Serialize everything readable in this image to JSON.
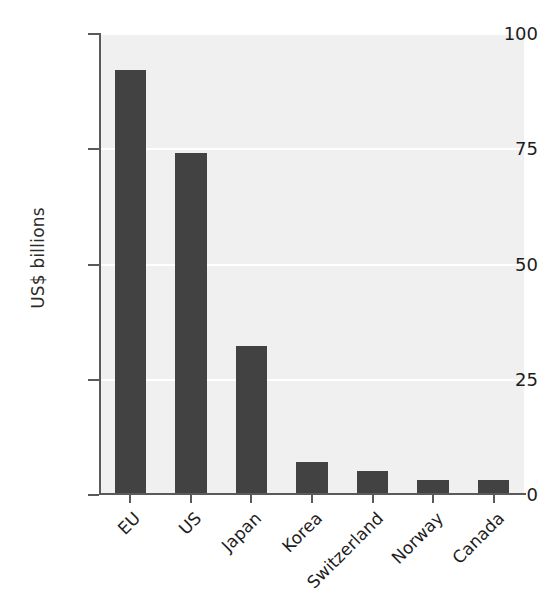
{
  "chart_data": {
    "type": "bar",
    "title": "",
    "xlabel": "",
    "ylabel": "US$ billions",
    "categories": [
      "EU",
      "US",
      "Japan",
      "Korea",
      "Switzerland",
      "Norway",
      "Canada"
    ],
    "values": [
      92,
      74,
      32,
      7,
      5,
      3,
      3
    ],
    "ylim": [
      0,
      100
    ],
    "yticks": [
      0,
      25,
      50,
      75,
      100
    ],
    "ytick_labels": [
      "0",
      "25",
      "50",
      "75",
      "100"
    ],
    "grid": "horizontal-white-gridlines",
    "legend": "none",
    "bar_color": "#424242",
    "plot_background": "#f0f0f0",
    "figure_background": "#ffffff",
    "axis_color": "#5a5a5a",
    "tick_label_rotation_x": -45
  }
}
